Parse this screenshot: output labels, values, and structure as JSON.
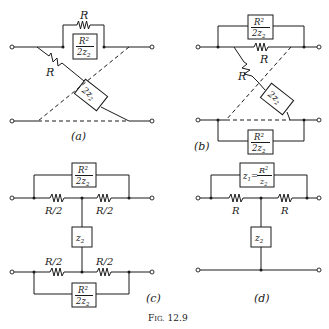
{
  "figure": {
    "caption": "Fig. 12.9",
    "caption_prefix": "F",
    "caption_small": "IG.",
    "caption_num": "12.9"
  },
  "panels": {
    "a": {
      "label": "(a)",
      "R_top": "R",
      "R_diag": "R",
      "box_top_num": "R",
      "box_top_sup": "2",
      "box_top_den": "2z",
      "box_top_sub": "2",
      "box_diag": "2z",
      "box_diag_sub": "2"
    },
    "b": {
      "label": "(b)",
      "R_top": "R",
      "R_diag": "R",
      "box_top_num": "R",
      "box_top_sup": "2",
      "box_top_den": "2z",
      "box_top_sub": "2",
      "box_diag": "2z",
      "box_diag_sub": "2",
      "box_bot_num": "R",
      "box_bot_sup": "2",
      "box_bot_den": "2z",
      "box_bot_sub": "2"
    },
    "c": {
      "label": "(c)",
      "R_tl": "R/2",
      "R_tr": "R/2",
      "R_bl": "R/2",
      "R_br": "R/2",
      "box_top_num": "R",
      "box_top_sup": "2",
      "box_top_den": "2z",
      "box_top_sub": "2",
      "box_mid": "z",
      "box_mid_sub": "2",
      "box_bot_num": "R",
      "box_bot_sup": "2",
      "box_bot_den": "2z",
      "box_bot_sub": "2"
    },
    "d": {
      "label": "(d)",
      "R_l": "R",
      "R_r": "R",
      "box_top_lhs": "z",
      "box_top_lhs_sub": "1",
      "box_top_eq": "=",
      "box_top_num": "R",
      "box_top_sup": "2",
      "box_top_den": "z",
      "box_top_den_sub": "2",
      "box_mid": "z",
      "box_mid_sub": "2"
    }
  }
}
